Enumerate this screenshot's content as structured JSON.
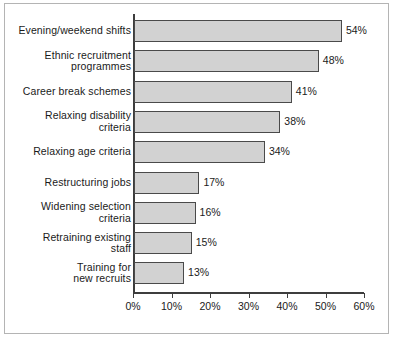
{
  "chart_data": {
    "type": "bar",
    "orientation": "horizontal",
    "title": "",
    "subtitle": "",
    "xlabel": "",
    "ylabel": "",
    "xlim": [
      0,
      60
    ],
    "xticks": [
      0,
      10,
      20,
      30,
      40,
      50,
      60
    ],
    "xtick_labels": [
      "0%",
      "10%",
      "20%",
      "30%",
      "40%",
      "50%",
      "60%"
    ],
    "grid": false,
    "legend": false,
    "value_suffix": "%",
    "bar_fill": "#d2d2d2",
    "bar_border": "#4a4a4a",
    "text_color": "#1a1a1a",
    "axis_color": "#3d3d3d",
    "categories": [
      "Evening/weekend shifts",
      "Ethnic recruitment\nprogrammes",
      "Career break schemes",
      "Relaxing disability\ncriteria",
      "Relaxing age criteria",
      "Restructuring jobs",
      "Widening selection\ncriteria",
      "Retraining existing\nstaff",
      "Training for\nnew recruits"
    ],
    "values": [
      54,
      48,
      41,
      38,
      34,
      17,
      16,
      15,
      13
    ],
    "data_labels": [
      "54%",
      "48%",
      "41%",
      "38%",
      "34%",
      "17%",
      "16%",
      "15%",
      "13%"
    ],
    "bars": [
      {
        "category": "Evening/weekend shifts",
        "value": 54,
        "label": "54%"
      },
      {
        "category": "Ethnic recruitment programmes",
        "value": 48,
        "label": "48%"
      },
      {
        "category": "Career break schemes",
        "value": 41,
        "label": "41%"
      },
      {
        "category": "Relaxing disability criteria",
        "value": 38,
        "label": "38%"
      },
      {
        "category": "Relaxing age criteria",
        "value": 34,
        "label": "34%"
      },
      {
        "category": "Restructuring jobs",
        "value": 17,
        "label": "17%"
      },
      {
        "category": "Widening selection criteria",
        "value": 16,
        "label": "16%"
      },
      {
        "category": "Retraining existing staff",
        "value": 15,
        "label": "15%"
      },
      {
        "category": "Training for new recruits",
        "value": 13,
        "label": "13%"
      }
    ]
  }
}
